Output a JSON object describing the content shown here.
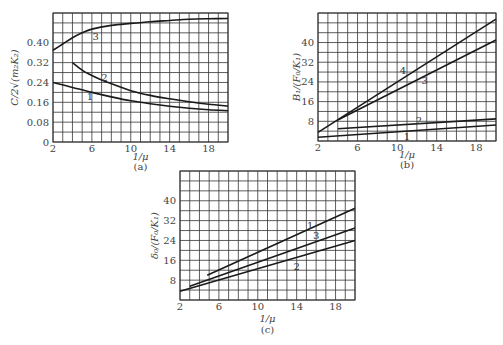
{
  "chart_data": [
    {
      "id": "a",
      "type": "line",
      "caption": "(a)",
      "xlabel": "1/μ",
      "ylabel": "C/2√(m₂K₂)",
      "xlim": [
        2,
        20
      ],
      "ylim": [
        0,
        0.52
      ],
      "xticks": [
        2,
        6,
        10,
        14,
        18
      ],
      "xtick_labels": [
        "2",
        "6",
        "10",
        "14",
        "18"
      ],
      "yticks": [
        0,
        0.08,
        0.16,
        0.24,
        0.32,
        0.4
      ],
      "ytick_labels": [
        "0",
        "0.08",
        "0.16",
        "0.24",
        "0.32",
        "0.40"
      ],
      "grid": true,
      "x_grid_step": 1,
      "y_grid_step": 0.04,
      "series": [
        {
          "name": "1",
          "x": [
            2,
            4,
            6,
            8,
            10,
            12,
            14,
            16,
            18,
            20
          ],
          "values": [
            0.24,
            0.22,
            0.2,
            0.182,
            0.166,
            0.154,
            0.144,
            0.136,
            0.13,
            0.126
          ],
          "label_at": [
            5.8,
            0.185
          ]
        },
        {
          "name": "2",
          "x": [
            4,
            5,
            6,
            7,
            8,
            10,
            12,
            14,
            16,
            18,
            20
          ],
          "values": [
            0.32,
            0.29,
            0.268,
            0.25,
            0.235,
            0.207,
            0.188,
            0.174,
            0.162,
            0.152,
            0.145
          ],
          "label_at": [
            7.3,
            0.26
          ]
        },
        {
          "name": "3",
          "x": [
            2,
            3,
            4,
            5,
            6,
            8,
            10,
            12,
            14,
            16,
            18,
            20
          ],
          "values": [
            0.37,
            0.395,
            0.42,
            0.44,
            0.455,
            0.47,
            0.478,
            0.485,
            0.49,
            0.495,
            0.497,
            0.498
          ],
          "label_at": [
            6.4,
            0.425
          ]
        }
      ]
    },
    {
      "id": "b",
      "type": "line",
      "caption": "(b)",
      "xlabel": "1/μ",
      "ylabel": "B₁/(F₀/K₁)",
      "xlim": [
        2,
        20
      ],
      "ylim": [
        0,
        52
      ],
      "xticks": [
        2,
        6,
        10,
        14,
        18
      ],
      "xtick_labels": [
        "2",
        "6",
        "10",
        "14",
        "18"
      ],
      "yticks": [
        8,
        16,
        24,
        32,
        40
      ],
      "ytick_labels": [
        "8",
        "16",
        "24",
        "32",
        "40"
      ],
      "grid": true,
      "x_grid_step": 1,
      "y_grid_step": 4,
      "series": [
        {
          "name": "1",
          "x": [
            2,
            20
          ],
          "values": [
            1.5,
            6.5
          ],
          "label_at": [
            11.0,
            2.0
          ]
        },
        {
          "name": "2",
          "x": [
            4,
            20
          ],
          "values": [
            5.0,
            9.0
          ],
          "label_at": [
            12.2,
            8.5
          ]
        },
        {
          "name": "3",
          "x": [
            4,
            20
          ],
          "values": [
            8.5,
            41.0
          ],
          "label_at": [
            12.8,
            24.5
          ]
        },
        {
          "name": "4",
          "x": [
            2,
            20
          ],
          "values": [
            3.5,
            49.5
          ],
          "label_at": [
            10.6,
            28.5
          ]
        }
      ]
    },
    {
      "id": "c",
      "type": "line",
      "caption": "(c)",
      "xlabel": "1/μ",
      "ylabel": "δ₀/(F₀/K₁)",
      "xlim": [
        2,
        20
      ],
      "ylim": [
        0,
        52
      ],
      "xticks": [
        2,
        6,
        10,
        14,
        18
      ],
      "xtick_labels": [
        "2",
        "6",
        "10",
        "14",
        "18"
      ],
      "yticks": [
        8,
        16,
        24,
        32,
        40
      ],
      "ytick_labels": [
        "8",
        "16",
        "24",
        "32",
        "40"
      ],
      "grid": true,
      "x_grid_step": 1,
      "y_grid_step": 4,
      "series": [
        {
          "name": "1",
          "x": [
            4.8,
            20
          ],
          "values": [
            10.0,
            37.0
          ],
          "label_at": [
            15.4,
            30.0
          ]
        },
        {
          "name": "2",
          "x": [
            2,
            20
          ],
          "values": [
            3.5,
            24.0
          ],
          "label_at": [
            14.0,
            13.5
          ]
        },
        {
          "name": "3",
          "x": [
            3,
            20
          ],
          "values": [
            5.5,
            29.0
          ],
          "label_at": [
            16.0,
            26.0
          ]
        }
      ]
    }
  ]
}
